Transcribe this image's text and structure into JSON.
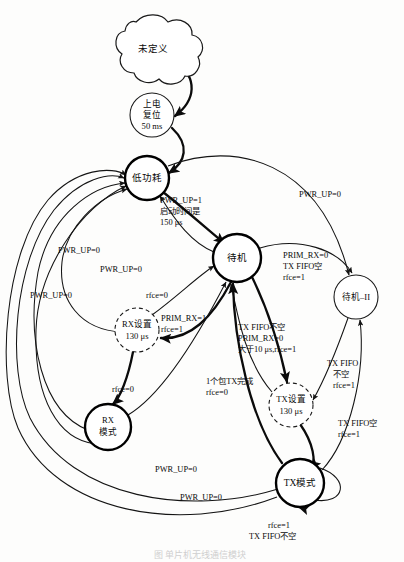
{
  "figure": {
    "caption": "图    单片机无线通信模块",
    "background_color": "#fdfdfc",
    "line_color": "#141414"
  },
  "nodes": {
    "undefined_cloud": {
      "label": "未定义",
      "shape": "cloud",
      "cx": 153,
      "cy": 48
    },
    "power_on_reset": {
      "line1": "上电",
      "line2": "复位",
      "line3": "50 ms",
      "shape": "circle-thin",
      "cx": 152,
      "cy": 115,
      "r": 22
    },
    "low_power": {
      "label": "低功耗",
      "shape": "circle-solid",
      "cx": 147,
      "cy": 178,
      "r": 22
    },
    "standby": {
      "label": "待机",
      "shape": "circle-solid",
      "cx": 237,
      "cy": 258,
      "r": 24
    },
    "standby_ii": {
      "label": "待机–II",
      "shape": "circle-thin",
      "cx": 356,
      "cy": 297,
      "r": 22
    },
    "rx_setup": {
      "line1": "RX设置",
      "line2": "130 μs",
      "shape": "circle-dashed",
      "cx": 137,
      "cy": 330,
      "r": 22
    },
    "tx_setup": {
      "line1": "TX设置",
      "line2": "130 μs",
      "shape": "circle-dashed",
      "cx": 291,
      "cy": 405,
      "r": 22
    },
    "rx_mode": {
      "line1": "RX",
      "line2": "模式",
      "shape": "circle-solid",
      "cx": 108,
      "cy": 427,
      "r": 23
    },
    "tx_mode": {
      "label": "TX模式",
      "shape": "circle-solid",
      "cx": 300,
      "cy": 483,
      "r": 24
    }
  },
  "edge_labels": {
    "pwr_up_1_startup": {
      "line1": "PWR_UP=1",
      "line2": "启动时间是",
      "line3": "150 μs",
      "x": 160,
      "y": 206
    },
    "pwr_up_0_top_right": {
      "line1": "PWR_UP=0",
      "x": 299,
      "y": 195
    },
    "pwr_up_0_upper_left": {
      "line1": "PWR_UP=0",
      "x": 58,
      "y": 251
    },
    "pwr_up_0_mid": {
      "line1": "PWR_UP=0",
      "x": 100,
      "y": 270
    },
    "pwr_up_0_lower_left": {
      "line1": "PWR_UP=0",
      "x": 30,
      "y": 296
    },
    "rfce_0_to_standby": {
      "line1": "rfce=0",
      "x": 146,
      "y": 296
    },
    "prim_rx_0_txfifo_empty": {
      "line1": "PRIM_RX=0",
      "line2": "TX FIFO空",
      "line3": "rfce=1",
      "x": 283,
      "y": 262
    },
    "prim_rx_1_rfce_1": {
      "line1": "PRIM_RX=1",
      "line2": "rfce=1",
      "x": 161,
      "y": 319
    },
    "tx_fifo_not_empty_block": {
      "line1": "TX FIFO不空",
      "line2": "PRIM_RX=0",
      "line3": "大于10 μs,rfce=1",
      "x": 238,
      "y": 333
    },
    "rfce_0_to_rx_mode": {
      "line1": "rfce=0",
      "x": 112,
      "y": 390
    },
    "one_packet_tx_done": {
      "line1": "1个包TX完成",
      "line2": "rfce=0",
      "x": 206,
      "y": 385
    },
    "tx_fifo_not_empty_right": {
      "line1": "TX FIFO",
      "line2": "不空",
      "line3": "rfce=1",
      "x": 327,
      "y": 368
    },
    "tx_fifo_empty_right": {
      "line1": "TX FIFO空",
      "line2": "rfce=1",
      "x": 340,
      "y": 427
    },
    "pwr_up_0_bottom_upper": {
      "line1": "PWR_UP=0",
      "x": 155,
      "y": 470
    },
    "pwr_up_0_bottom_lower": {
      "line1": "PWR_UP=0",
      "x": 180,
      "y": 498
    },
    "tx_self_loop": {
      "line1": "rfce=1",
      "line2": "TX FIFO不空",
      "x": 268,
      "y": 531
    }
  }
}
